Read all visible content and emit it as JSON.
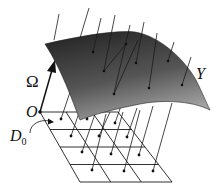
{
  "figure": {
    "type": "diagram",
    "labels": {
      "omega": "Ω",
      "origin": "O",
      "domain": "D",
      "domain_sub": "0",
      "surface": "Y"
    },
    "colors": {
      "surface_dark": "#2a2a2a",
      "surface_light": "#9a9a9a",
      "line": "#1a1a1a",
      "background": "#ffffff"
    },
    "grid": {
      "rows": 4,
      "cols": 3
    }
  }
}
